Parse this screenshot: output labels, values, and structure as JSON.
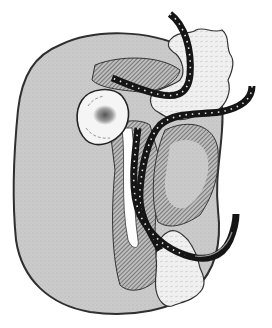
{
  "illustration": {
    "subject": "kidney-with-ureters",
    "style": "engraved line drawing",
    "caption_fragment": "",
    "colors": {
      "background": "#ffffff",
      "organ_fill": "#c9c9c9",
      "organ_outline": "#3a3a3a",
      "hatch": "#5a5a5a",
      "tube": "#151515",
      "tube_dots": "#e8e8e8",
      "cyst_fill": "#f4f4f4",
      "tissue_fill": "#ededed"
    },
    "parts": [
      {
        "id": "kidney-body",
        "label": "kidney"
      },
      {
        "id": "cyst",
        "label": "cyst"
      },
      {
        "id": "upper-tissue",
        "label": "fatty tissue (upper)"
      },
      {
        "id": "lower-tissue",
        "label": "fatty tissue (lower)"
      },
      {
        "id": "tube-upper",
        "label": "ureter / catheter (upper)"
      },
      {
        "id": "tube-middle",
        "label": "ureter / catheter (middle)"
      },
      {
        "id": "tube-lower",
        "label": "ureter / catheter (lower)"
      }
    ]
  }
}
